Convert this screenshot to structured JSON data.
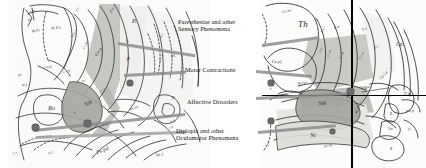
{
  "figure": {
    "type": "anatomical-atlas-diagram",
    "width": 426,
    "height": 168,
    "background": "#ffffff",
    "ink": "#2b2b2b",
    "leader_color": "#8d8d8d",
    "dot_color": "#6b6b6b",
    "shade_light": "#e9e9e6",
    "shade_mid": "#cfcfcb",
    "shade_dark": "#a9a9a4"
  },
  "callouts": [
    {
      "id": "sensory",
      "text": "Paresthesiae and other\nSensory Phenomena"
    },
    {
      "id": "motor",
      "text": "Motor Contractions"
    },
    {
      "id": "affective",
      "text": "Affective Disorders"
    },
    {
      "id": "oculomotor",
      "text": "Diplopia and other\nOculomotor Phenomena"
    }
  ],
  "left_plate": {
    "name": "left-atlas-plate",
    "labels": [
      {
        "t": "s.m",
        "x": 22,
        "y": 10,
        "s": 3.4,
        "r": -10
      },
      {
        "t": "Pf",
        "x": 20,
        "y": 19,
        "s": 3.4,
        "r": -10
      },
      {
        "t": "M.Fi",
        "x": 24,
        "y": 30,
        "s": 3.6,
        "r": -8
      },
      {
        "t": "M.Fa",
        "x": 43,
        "y": 26,
        "s": 4.2,
        "r": -6
      },
      {
        "t": "Ce",
        "x": 68,
        "y": 8,
        "s": 3.6,
        "r": -60
      },
      {
        "t": "Z.o",
        "x": 101,
        "y": 8,
        "s": 4.0,
        "r": -60
      },
      {
        "t": "V.o.i",
        "x": 62,
        "y": 32,
        "s": 4.0,
        "r": -62
      },
      {
        "t": "V.i.m",
        "x": 74,
        "y": 44,
        "s": 3.6,
        "r": -62
      },
      {
        "t": "V.o.p",
        "x": 86,
        "y": 50,
        "s": 4.4,
        "r": -58
      },
      {
        "t": "P.",
        "x": 124,
        "y": 18,
        "s": 6.4,
        "r": 0
      },
      {
        "t": "i.",
        "x": 118,
        "y": 38,
        "s": 5.6,
        "r": 0
      },
      {
        "t": "p",
        "x": 119,
        "y": 56,
        "s": 5.6,
        "r": 0
      },
      {
        "t": "Z.c",
        "x": 152,
        "y": 34,
        "s": 3.6,
        "r": -66
      },
      {
        "t": "d.i.m",
        "x": 150,
        "y": 56,
        "s": 3.4,
        "r": -66
      },
      {
        "t": "Pl.",
        "x": 163,
        "y": 54,
        "s": 4.4,
        "r": -20
      },
      {
        "t": "I.m.p",
        "x": 36,
        "y": 66,
        "s": 3.4,
        "r": -12
      },
      {
        "t": "c.i.m",
        "x": 55,
        "y": 70,
        "s": 3.4,
        "r": -14
      },
      {
        "t": "Pu",
        "x": 10,
        "y": 74,
        "s": 3.4,
        "r": -18
      },
      {
        "t": "M.s",
        "x": 14,
        "y": 84,
        "s": 3.4,
        "r": -12
      },
      {
        "t": "Ps",
        "x": 74,
        "y": 80,
        "s": 3.4,
        "r": -22
      },
      {
        "t": "Ru",
        "x": 40,
        "y": 105,
        "s": 6.2,
        "r": -4
      },
      {
        "t": "Sth",
        "x": 76,
        "y": 100,
        "s": 6.0,
        "r": -22
      },
      {
        "t": "V",
        "x": 66,
        "y": 112,
        "s": 3.6,
        "r": -24
      },
      {
        "t": "M.rui",
        "x": 122,
        "y": 107,
        "s": 3.6,
        "r": -22
      },
      {
        "t": "I.e",
        "x": 5,
        "y": 152,
        "s": 3.4,
        "r": -8
      },
      {
        "t": "Ni.l",
        "x": 40,
        "y": 152,
        "s": 3.4,
        "r": -14
      },
      {
        "t": "Ps.pd",
        "x": 88,
        "y": 148,
        "s": 5.4,
        "r": -22
      },
      {
        "t": "Ve.l",
        "x": 148,
        "y": 153,
        "s": 4.4,
        "r": -6
      },
      {
        "t": "B",
        "x": 164,
        "y": 96,
        "s": 4.4,
        "r": -12
      },
      {
        "t": "s.d",
        "x": 161,
        "y": 126,
        "s": 3.2,
        "r": -12
      },
      {
        "t": "A.d",
        "x": 162,
        "y": 120,
        "s": 3.2,
        "r": -12
      },
      {
        "t": "Ac",
        "x": 152,
        "y": 72,
        "s": 3.2,
        "r": -40
      }
    ]
  },
  "right_plate": {
    "name": "right-atlas-plate",
    "labels": [
      {
        "t": "Ce.mc",
        "x": 20,
        "y": 10,
        "s": 3.6,
        "r": -12
      },
      {
        "t": "Th",
        "x": 36,
        "y": 20,
        "s": 9.0,
        "r": 0
      },
      {
        "t": "Ce.pf",
        "x": 10,
        "y": 60,
        "s": 4.0,
        "r": 0
      },
      {
        "t": "Z.o.i",
        "x": 58,
        "y": 28,
        "s": 3.4,
        "r": -70
      },
      {
        "t": "Z.m",
        "x": 72,
        "y": 26,
        "s": 3.6,
        "r": -12
      },
      {
        "t": "Z.o",
        "x": 100,
        "y": 28,
        "s": 3.6,
        "r": -12
      },
      {
        "t": "V.o.i",
        "x": 56,
        "y": 48,
        "s": 3.2,
        "r": -72
      },
      {
        "t": "V.i.m",
        "x": 64,
        "y": 52,
        "s": 3.2,
        "r": -72
      },
      {
        "t": "V.o.p",
        "x": 76,
        "y": 54,
        "s": 3.6,
        "r": -60
      },
      {
        "t": "V.o.a",
        "x": 96,
        "y": 54,
        "s": 3.6,
        "r": -60
      },
      {
        "t": "Pl.i",
        "x": 112,
        "y": 46,
        "s": 3.4,
        "r": -34
      },
      {
        "t": "Cp.",
        "x": 134,
        "y": 42,
        "s": 5.4,
        "r": 0
      },
      {
        "t": "Cp.i.p",
        "x": 117,
        "y": 74,
        "s": 3.8,
        "r": -46
      },
      {
        "t": "s",
        "x": 8,
        "y": 88,
        "s": 3.8,
        "r": -8
      },
      {
        "t": "c.s",
        "x": 30,
        "y": 96,
        "s": 4.2,
        "r": -6
      },
      {
        "t": "M.rui",
        "x": 36,
        "y": 82,
        "s": 3.6,
        "r": -10
      },
      {
        "t": "Sth",
        "x": 56,
        "y": 100,
        "s": 6.2,
        "r": -4
      },
      {
        "t": "M.mi",
        "x": 92,
        "y": 108,
        "s": 3.6,
        "r": -66
      },
      {
        "t": "Ni",
        "x": 48,
        "y": 132,
        "s": 6.0,
        "r": -4
      },
      {
        "t": "Ni.la",
        "x": 62,
        "y": 145,
        "s": 3.8,
        "r": -14
      },
      {
        "t": "i.e",
        "x": 5,
        "y": 142,
        "s": 3.4,
        "r": -82
      },
      {
        "t": "P.m",
        "x": 142,
        "y": 92,
        "s": 4.6,
        "r": 0
      },
      {
        "t": "pm.p",
        "x": 144,
        "y": 110,
        "s": 3.8,
        "r": 0
      },
      {
        "t": "P.i",
        "x": 126,
        "y": 96,
        "s": 3.4,
        "r": -72
      },
      {
        "t": "L",
        "x": 128,
        "y": 112,
        "s": 4.6,
        "r": 0
      },
      {
        "t": "Tm",
        "x": 126,
        "y": 128,
        "s": 3.6,
        "r": -8
      },
      {
        "t": "g",
        "x": 128,
        "y": 146,
        "s": 4.4,
        "r": 0
      },
      {
        "t": "Si",
        "x": 146,
        "y": 128,
        "s": 3.4,
        "r": -6
      },
      {
        "t": "pd.i",
        "x": 104,
        "y": 86,
        "s": 3.2,
        "r": -4
      }
    ],
    "crosshair": {
      "x": 89,
      "y": 95
    }
  },
  "dots": [
    {
      "x": 130,
      "y": 83,
      "d": 6.0
    },
    {
      "x": 36,
      "y": 128,
      "d": 7.0
    },
    {
      "x": 87,
      "y": 124,
      "d": 6.5
    },
    {
      "x": 271,
      "y": 83,
      "d": 5.5
    },
    {
      "x": 350,
      "y": 91,
      "d": 6.5
    },
    {
      "x": 271,
      "y": 121,
      "d": 5.5
    },
    {
      "x": 332,
      "y": 131,
      "d": 4.5
    }
  ]
}
